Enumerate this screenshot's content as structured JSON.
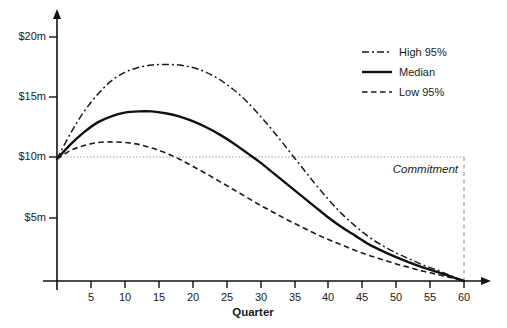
{
  "chart_data": {
    "type": "line",
    "title": "",
    "xlabel": "Quarter",
    "ylabel": "",
    "xlim": [
      0,
      63
    ],
    "ylim": [
      0,
      21
    ],
    "grid": false,
    "legend_position": "top-right",
    "x_ticks": [
      5,
      10,
      15,
      20,
      25,
      30,
      35,
      40,
      45,
      50,
      55,
      60
    ],
    "x_tick_labels": [
      "5",
      "10",
      "15",
      "20",
      "25",
      "30",
      "35",
      "40",
      "45",
      "50",
      "55",
      "60"
    ],
    "y_ticks": [
      5,
      10,
      15,
      20
    ],
    "y_tick_labels": [
      "$5m",
      "$10m",
      "$15m",
      "$20m"
    ],
    "x": [
      0,
      2,
      4,
      6,
      8,
      10,
      12,
      14,
      16,
      18,
      20,
      22,
      24,
      26,
      28,
      30,
      32,
      34,
      36,
      38,
      40,
      42,
      44,
      46,
      48,
      50,
      52,
      54,
      56,
      58,
      60
    ],
    "series": [
      {
        "name": "High 95%",
        "style": "dash-dot",
        "color": "#1a1a1a",
        "values": [
          10.0,
          12.1,
          13.9,
          15.3,
          16.4,
          17.1,
          17.5,
          17.7,
          17.75,
          17.7,
          17.5,
          17.1,
          16.5,
          15.7,
          14.7,
          13.5,
          12.2,
          10.8,
          9.4,
          8.0,
          6.7,
          5.5,
          4.5,
          3.6,
          2.9,
          2.3,
          1.8,
          1.3,
          0.9,
          0.45,
          0.0
        ]
      },
      {
        "name": "Median",
        "style": "solid",
        "color": "#111111",
        "values": [
          10.0,
          11.2,
          12.2,
          13.0,
          13.5,
          13.8,
          13.9,
          13.9,
          13.75,
          13.5,
          13.1,
          12.6,
          12.0,
          11.3,
          10.5,
          9.7,
          8.8,
          7.9,
          7.0,
          6.1,
          5.2,
          4.4,
          3.7,
          3.0,
          2.45,
          1.95,
          1.5,
          1.1,
          0.75,
          0.38,
          0.0
        ]
      },
      {
        "name": "Low 95%",
        "style": "dashed",
        "color": "#1a1a1a",
        "values": [
          10.0,
          10.7,
          11.1,
          11.35,
          11.4,
          11.35,
          11.2,
          10.9,
          10.5,
          10.0,
          9.4,
          8.8,
          8.15,
          7.5,
          6.85,
          6.2,
          5.6,
          5.0,
          4.45,
          3.9,
          3.4,
          2.95,
          2.5,
          2.1,
          1.75,
          1.4,
          1.1,
          0.8,
          0.55,
          0.28,
          0.0
        ]
      }
    ],
    "annotations": [
      {
        "name": "commitment",
        "label": "Commitment",
        "value": 10,
        "x_end": 60,
        "style": "dotted-horizontal-dashed-vertical"
      }
    ]
  },
  "legend": {
    "items": [
      {
        "label": "High 95%",
        "style": "dash-dot"
      },
      {
        "label": "Median",
        "style": "solid"
      },
      {
        "label": "Low 95%",
        "style": "dashed"
      }
    ]
  },
  "axes": {
    "x_title": "Quarter",
    "y_tick_labels": [
      "$20m",
      "$15m",
      "$10m",
      "$5m"
    ],
    "x_tick_labels": [
      "5",
      "10",
      "15",
      "20",
      "25",
      "30",
      "35",
      "40",
      "45",
      "50",
      "55",
      "60"
    ]
  },
  "annotation": {
    "commitment_label": "Commitment"
  },
  "colors": {
    "axis": "#111111",
    "line": "#1a1a1a",
    "commitment": "#999999",
    "background": "#ffffff"
  }
}
